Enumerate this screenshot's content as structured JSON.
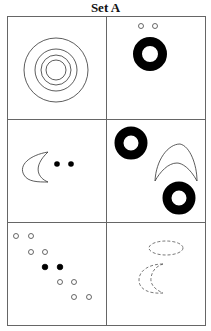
{
  "title": "Set A",
  "grid": {
    "rows": 3,
    "cols": 2,
    "line_color": "#666666"
  },
  "cells": [
    {
      "id": "r1c1",
      "content": "four concentric circles"
    },
    {
      "id": "r1c2",
      "content": "two small open circles above one thick black ring"
    },
    {
      "id": "r2c1",
      "content": "crescent moon followed by two filled dots"
    },
    {
      "id": "r2c2",
      "content": "two thick black rings and a crescent arch"
    },
    {
      "id": "r3c1",
      "content": "diagonal of circle pairs: open, open, filled, open, open"
    },
    {
      "id": "r3c2",
      "content": "dashed ellipse above dashed crescent"
    }
  ]
}
